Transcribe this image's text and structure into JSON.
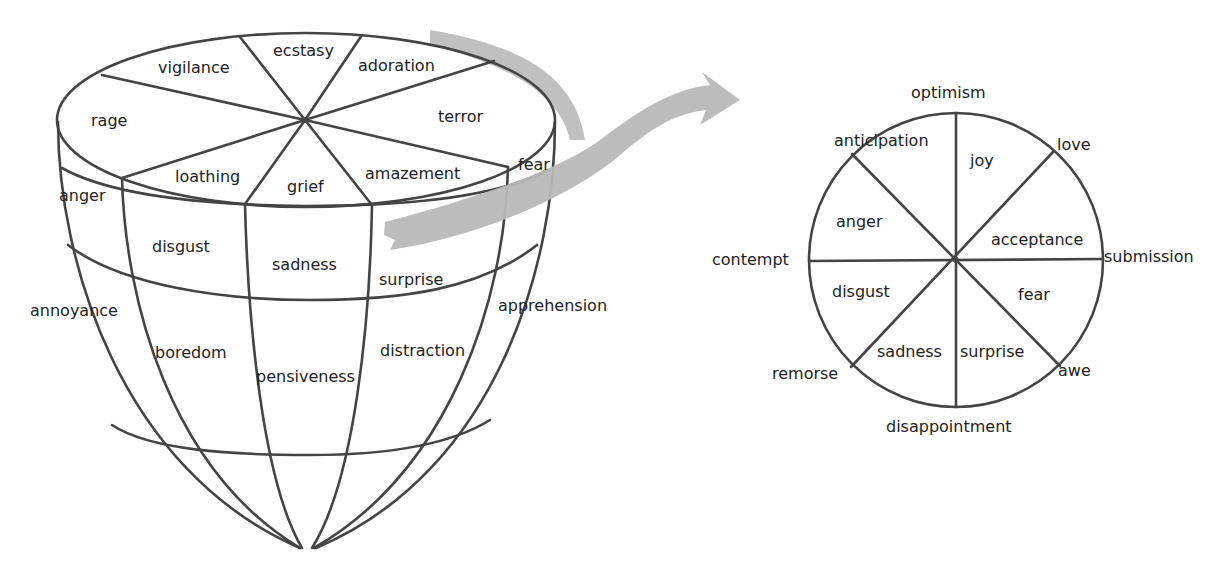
{
  "colors": {
    "line": "#444444",
    "text": "#222222",
    "arrow": "#b8b8b8",
    "background": "#ffffff"
  },
  "cone_model": {
    "top_face": {
      "labels": [
        "ecstasy",
        "adoration",
        "terror",
        "amazement",
        "grief",
        "loathing",
        "rage",
        "vigilance"
      ]
    },
    "band_1": {
      "labels": [
        "anger",
        "disgust",
        "sadness",
        "surprise",
        "fear"
      ]
    },
    "band_2": {
      "labels": [
        "annoyance",
        "boredom",
        "pensiveness",
        "distraction",
        "apprehension"
      ]
    }
  },
  "arrow": {
    "icon": "curved-arrow-icon"
  },
  "wheel": {
    "inner_labels": [
      "joy",
      "acceptance",
      "fear",
      "surprise",
      "sadness",
      "disgust",
      "anger",
      "anticipation"
    ],
    "outer_labels": [
      "optimism",
      "love",
      "submission",
      "awe",
      "disappointment",
      "remorse",
      "contempt"
    ]
  },
  "labels": {
    "ecstasy": "ecstasy",
    "adoration": "adoration",
    "terror": "terror",
    "amazement": "amazement",
    "grief": "grief",
    "loathing": "loathing",
    "rage": "rage",
    "vigilance": "vigilance",
    "anger": "anger",
    "disgust": "disgust",
    "sadness": "sadness",
    "surprise": "surprise",
    "fear": "fear",
    "annoyance": "annoyance",
    "boredom": "boredom",
    "pensiveness": "pensiveness",
    "distraction": "distraction",
    "apprehension": "apprehension",
    "w_optimism": "optimism",
    "w_anticipation": "anticipation",
    "w_joy": "joy",
    "w_love": "love",
    "w_anger": "anger",
    "w_acceptance": "acceptance",
    "w_contempt": "contempt",
    "w_submission": "submission",
    "w_disgust": "disgust",
    "w_fear": "fear",
    "w_sadness": "sadness",
    "w_surprise": "surprise",
    "w_remorse": "remorse",
    "w_awe": "awe",
    "w_disappointment": "disappointment"
  }
}
